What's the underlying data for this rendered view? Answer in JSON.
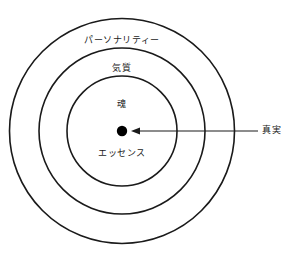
{
  "diagram": {
    "background_color": "#ffffff",
    "stroke_color": "#1a1a1a",
    "text_color": "#1a1a1a",
    "center": {
      "x": 122,
      "y": 131
    },
    "rings": [
      {
        "id": "personality",
        "label": "パーソナリティー",
        "radius": 113
      },
      {
        "id": "temperament",
        "label": "気質",
        "radius": 83
      },
      {
        "id": "soul",
        "label": "魂",
        "radius": 55
      }
    ],
    "inner_bottom_label": "エッセンス",
    "center_dot": {
      "label": "center-dot",
      "radius": 5,
      "color": "#000000"
    },
    "callout": {
      "label": "真実",
      "arrow_from_x": 258,
      "arrow_to_x": 133,
      "arrow_y": 131
    }
  }
}
